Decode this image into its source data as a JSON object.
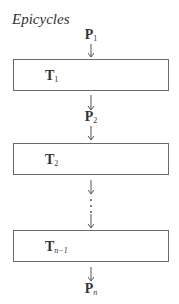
{
  "title": "Epicycles",
  "inputs": [
    {
      "id": "p1",
      "base": "P",
      "sub": "1"
    },
    {
      "id": "p2",
      "base": "P",
      "sub": "2"
    },
    {
      "id": "pn",
      "base": "P",
      "sub": "n"
    }
  ],
  "stages": [
    {
      "id": "t1",
      "base": "T",
      "sub": "1"
    },
    {
      "id": "t2",
      "base": "T",
      "sub": "2"
    },
    {
      "id": "tn1",
      "base": "T",
      "sub": "n−1"
    }
  ],
  "ellipsis": "⋮",
  "colors": {
    "line": "#6a6a6a",
    "text": "#333333",
    "background": "#ffffff"
  }
}
